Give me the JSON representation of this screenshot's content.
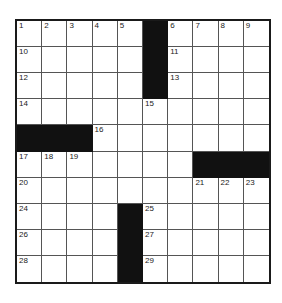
{
  "puzzle": {
    "rows": 10,
    "cols": 10,
    "black_color": "#111111",
    "blacks": [
      [
        0,
        5
      ],
      [
        1,
        5
      ],
      [
        2,
        5
      ],
      [
        4,
        0
      ],
      [
        4,
        1
      ],
      [
        4,
        2
      ],
      [
        5,
        7
      ],
      [
        5,
        8
      ],
      [
        5,
        9
      ],
      [
        7,
        4
      ],
      [
        8,
        4
      ],
      [
        9,
        4
      ]
    ],
    "numbers": [
      {
        "r": 0,
        "c": 0,
        "n": "1"
      },
      {
        "r": 0,
        "c": 1,
        "n": "2"
      },
      {
        "r": 0,
        "c": 2,
        "n": "3"
      },
      {
        "r": 0,
        "c": 3,
        "n": "4"
      },
      {
        "r": 0,
        "c": 4,
        "n": "5"
      },
      {
        "r": 0,
        "c": 6,
        "n": "6"
      },
      {
        "r": 0,
        "c": 7,
        "n": "7"
      },
      {
        "r": 0,
        "c": 8,
        "n": "8"
      },
      {
        "r": 0,
        "c": 9,
        "n": "9"
      },
      {
        "r": 1,
        "c": 0,
        "n": "10"
      },
      {
        "r": 1,
        "c": 6,
        "n": "11"
      },
      {
        "r": 2,
        "c": 0,
        "n": "12"
      },
      {
        "r": 2,
        "c": 6,
        "n": "13"
      },
      {
        "r": 3,
        "c": 0,
        "n": "14"
      },
      {
        "r": 3,
        "c": 5,
        "n": "15"
      },
      {
        "r": 4,
        "c": 3,
        "n": "16"
      },
      {
        "r": 5,
        "c": 0,
        "n": "17"
      },
      {
        "r": 5,
        "c": 1,
        "n": "18"
      },
      {
        "r": 5,
        "c": 2,
        "n": "19"
      },
      {
        "r": 6,
        "c": 0,
        "n": "20"
      },
      {
        "r": 6,
        "c": 7,
        "n": "21"
      },
      {
        "r": 6,
        "c": 8,
        "n": "22"
      },
      {
        "r": 6,
        "c": 9,
        "n": "23"
      },
      {
        "r": 7,
        "c": 0,
        "n": "24"
      },
      {
        "r": 7,
        "c": 5,
        "n": "25"
      },
      {
        "r": 8,
        "c": 0,
        "n": "26"
      },
      {
        "r": 8,
        "c": 5,
        "n": "27"
      },
      {
        "r": 9,
        "c": 0,
        "n": "28"
      },
      {
        "r": 9,
        "c": 5,
        "n": "29"
      }
    ]
  }
}
